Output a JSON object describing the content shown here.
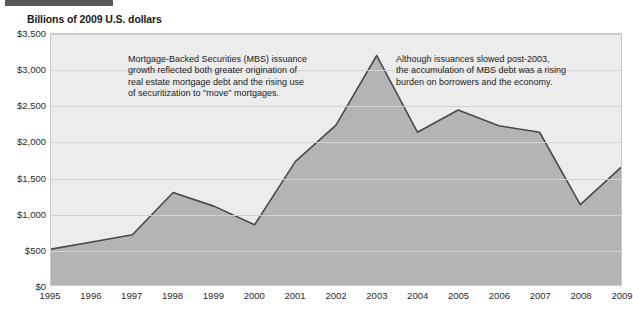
{
  "header": {
    "rule_color": "#58585a",
    "units_title": "Billions of 2009 U.S. dollars"
  },
  "chart_data": {
    "type": "area",
    "title": "Billions of 2009 U.S. dollars",
    "xlabel": "",
    "ylabel": "Billions of 2009 U.S. dollars",
    "categories": [
      "1995",
      "1996",
      "1997",
      "1998",
      "1999",
      "2000",
      "2001",
      "2002",
      "2003",
      "2004",
      "2005",
      "2006",
      "2007",
      "2008",
      "2009"
    ],
    "values": [
      500,
      600,
      700,
      1290,
      1100,
      840,
      1720,
      2230,
      3200,
      2130,
      2440,
      2220,
      2130,
      1120,
      1640
    ],
    "series": [
      {
        "name": "MBS issuance",
        "values": [
          500,
          600,
          700,
          1290,
          1100,
          840,
          1720,
          2230,
          3200,
          2130,
          2440,
          2220,
          2130,
          1120,
          1640
        ]
      }
    ],
    "ylim": [
      0,
      3500
    ],
    "yticks": [
      0,
      500,
      1000,
      1500,
      2000,
      2500,
      3000,
      3500
    ],
    "ytick_labels": [
      "$0",
      "$500",
      "$1,000",
      "$1,500",
      "$2,000",
      "$2,500",
      "$3,000",
      "$3,500"
    ],
    "xtick_labels": [
      "1995",
      "1996",
      "1997",
      "1998",
      "1999",
      "2000",
      "2001",
      "2002",
      "2003",
      "2004",
      "2005",
      "2006",
      "2007",
      "2008",
      "2009"
    ],
    "grid": true,
    "legend": "none",
    "fill_color": "#b4b4b4",
    "line_color": "#4a4a4a",
    "plot_background": "#ececec",
    "annotations": [
      "Mortgage-Backed Securities (MBS) issuance\ngrowth reflected both greater origination of\nreal estate mortgage debt and the rising use\nof securitization to \"move\" mortgages.",
      "Although issuances slowed post-2003,\nthe accumulation of MBS debt was a rising\nburden on borrowers and the economy."
    ]
  }
}
